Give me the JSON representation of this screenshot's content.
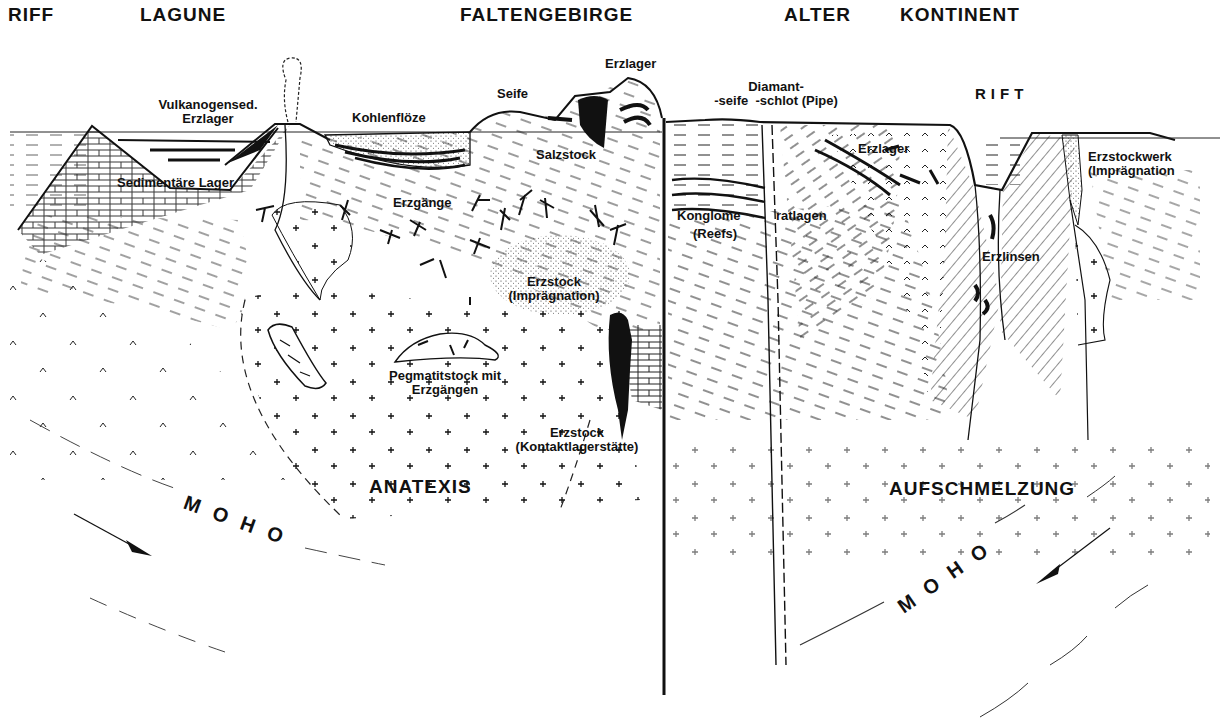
{
  "diagram": {
    "title_regions": {
      "riff": "RIFF",
      "lagune": "LAGUNE",
      "faltengebirge": "FALTENGEBIRGE",
      "alter": "ALTER",
      "kontinent": "KONTINENT",
      "rift": "RIFT"
    },
    "labels": {
      "vulkanogensed_1": "Vulkanogensed.",
      "vulkanogensed_2": "Erzlager",
      "sedimentaere_lager": "Sedimentäre Lager",
      "kohlenfloeze": "Kohlenflöze",
      "seife": "Seife",
      "erzlager_top": "Erzlager",
      "salzstock": "Salzstock",
      "erzgaenge": "Erzgänge",
      "erzstock_impr_1": "Erzstock",
      "erzstock_impr_2": "(Imprägnation)",
      "pegmatit_1": "Pegmatitstock mit",
      "pegmatit_2": "Erzgängen",
      "erzstock_kontakt_1": "Erzstock",
      "erzstock_kontakt_2": "(Kontaktlagerstätte)",
      "anatexis": "ANATEXIS",
      "moho_left": "MOHO",
      "diamant_1": "Diamant-",
      "diamant_2": "-seife  -schlot (Pipe)",
      "erzlager_right": "Erzlager",
      "konglome": "Konglome",
      "ratlagen": "ratlagen",
      "reefs": "(Reefs)",
      "erzlinsen": "Erzlinsen",
      "erzstockwerk_1": "Erzstockwerk",
      "erzstockwerk_2": "(Imprägnation",
      "aufschmelzung": "AUFSCHMELZUNG",
      "moho_right": "MOHO"
    },
    "colors": {
      "ink": "#111111",
      "background": "#ffffff"
    }
  }
}
